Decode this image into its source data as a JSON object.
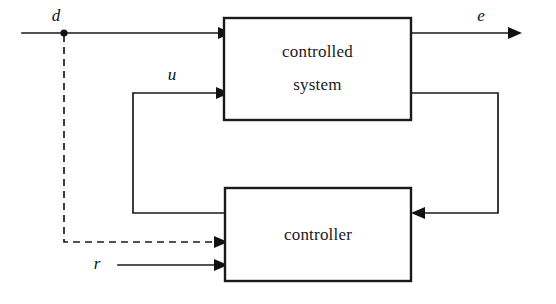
{
  "diagram": {
    "type": "control-system-block-diagram",
    "background_color": "#ffffff",
    "line_color": "#1a1a1a",
    "blocks": [
      {
        "id": "controlled-system",
        "label_line1": "controlled",
        "label_line2": "system",
        "x": 224,
        "y": 18,
        "width": 187,
        "height": 102
      },
      {
        "id": "controller",
        "label_line1": "controller",
        "x": 225,
        "y": 188,
        "width": 186,
        "height": 93
      }
    ],
    "signals": [
      {
        "id": "disturbance",
        "label": "d",
        "description": "disturbance input to controlled system, branches to controller",
        "style": "solid",
        "label_x": 56,
        "label_y": 17
      },
      {
        "id": "control-input",
        "label": "u",
        "description": "control signal from controller to controlled system",
        "style": "solid",
        "label_x": 172,
        "label_y": 76
      },
      {
        "id": "error-output",
        "label": "e",
        "description": "output of controlled system",
        "style": "solid",
        "label_x": 481,
        "label_y": 17
      },
      {
        "id": "reference",
        "label": "r",
        "description": "reference input to controller",
        "style": "solid",
        "label_x": 97,
        "label_y": 265
      }
    ],
    "connections": [
      {
        "id": "d-to-controlled-system",
        "from": "external-left",
        "to": "controlled-system",
        "style": "solid",
        "arrow": true
      },
      {
        "id": "d-branch-to-controller",
        "from": "d-junction",
        "to": "controller",
        "style": "dashed",
        "arrow": true
      },
      {
        "id": "u-controller-to-controlled-system",
        "from": "controller",
        "to": "controlled-system",
        "style": "solid",
        "arrow": true
      },
      {
        "id": "controlled-system-to-e",
        "from": "controlled-system",
        "to": "external-right",
        "style": "solid",
        "arrow": true
      },
      {
        "id": "feedback-controlled-system-to-controller",
        "from": "controlled-system",
        "to": "controller",
        "style": "solid",
        "arrow": true
      },
      {
        "id": "r-to-controller",
        "from": "external-left",
        "to": "controller",
        "style": "solid",
        "arrow": true
      }
    ]
  }
}
